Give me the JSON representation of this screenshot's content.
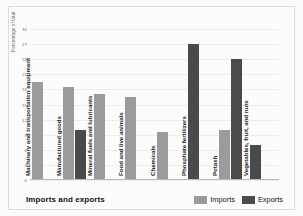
{
  "chart_data": {
    "type": "bar",
    "title": "Imports and exports",
    "xlabel": "",
    "ylabel": "Percentage of total",
    "ylim": [
      0,
      30
    ],
    "ytick_step": 3,
    "yticks": [
      30,
      27,
      24,
      21,
      18,
      15,
      12,
      9,
      6,
      3,
      0
    ],
    "grid": true,
    "legend_position": "bottom-right",
    "categories": [
      "Machinery and transportation equipment",
      "Manufactured goods",
      "Mineral fuels and lubricants",
      "Food and live animals",
      "Chemicals",
      "Phosphate fertilizers",
      "Potash",
      "Vegetables, fruit, and nuts"
    ],
    "series": [
      {
        "name": "Imports",
        "color": "#9b9b9b",
        "values": [
          19.5,
          18.5,
          17,
          16.5,
          9.5,
          null,
          10,
          null
        ]
      },
      {
        "name": "Exports",
        "color": "#4a4a4a",
        "values": [
          null,
          10,
          null,
          null,
          null,
          27,
          24,
          7
        ]
      }
    ]
  },
  "axis": {
    "ylabel": "Percentage of total",
    "tick_labels": [
      "30",
      "27",
      "24",
      "21",
      "18",
      "15",
      "12",
      "9",
      "6",
      "3",
      "0"
    ]
  },
  "footer": {
    "title": "Imports and exports",
    "legend": [
      {
        "label": "Imports",
        "color": "#9b9b9b"
      },
      {
        "label": "Exports",
        "color": "#4a4a4a"
      }
    ]
  }
}
